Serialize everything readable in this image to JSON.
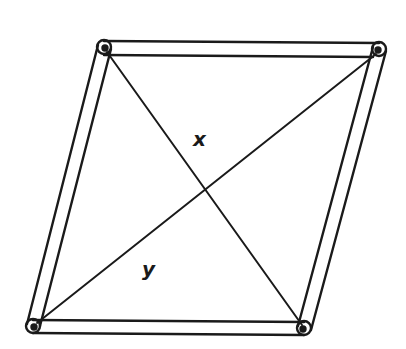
{
  "diagram": {
    "type": "parallelogram-linkage",
    "stroke_color": "#1a1a1a",
    "background": "#ffffff",
    "vertices": {
      "top_left": [
        104,
        47
      ],
      "top_right": [
        379,
        49
      ],
      "bottom_left": [
        33,
        326
      ],
      "bottom_right": [
        304,
        328
      ]
    },
    "diagonals": [
      {
        "name": "x",
        "from": "top_left",
        "to": "bottom_right"
      },
      {
        "name": "y",
        "from": "top_right",
        "to": "bottom_left"
      }
    ],
    "labels": {
      "x": {
        "text": "x",
        "pos": [
          201,
          146
        ]
      },
      "y": {
        "text": "y",
        "pos": [
          150,
          276
        ]
      }
    }
  }
}
